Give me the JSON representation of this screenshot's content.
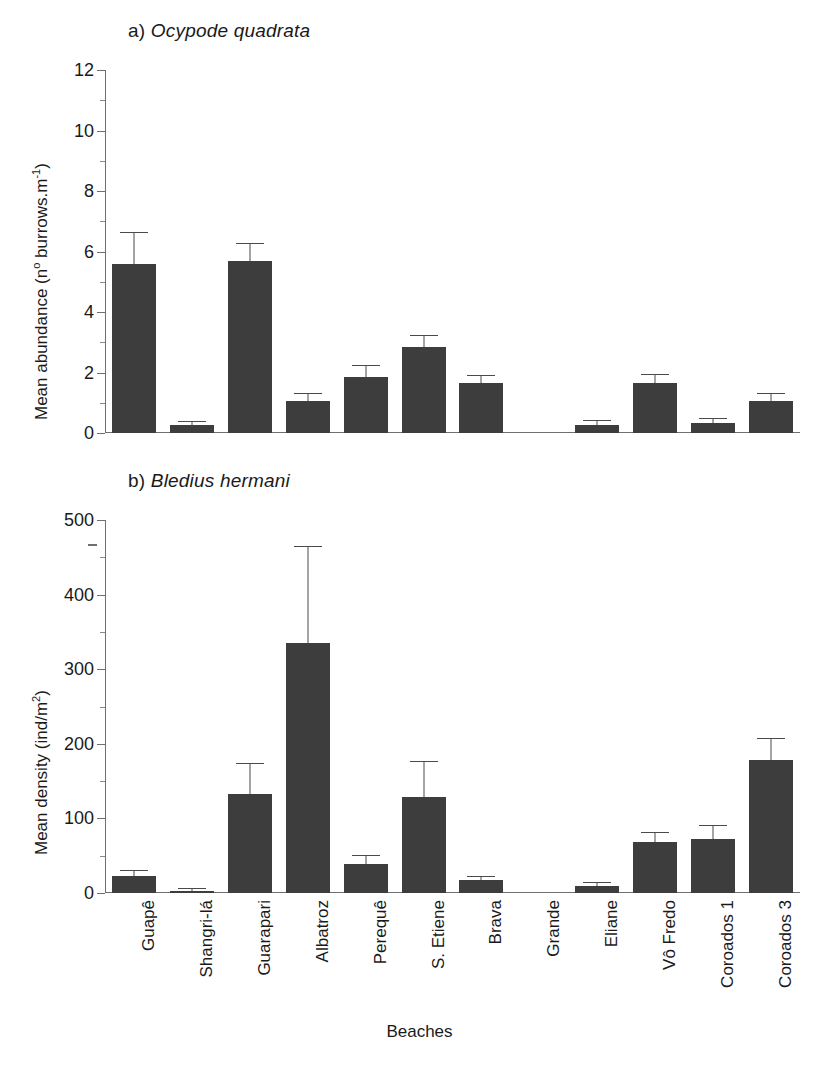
{
  "figure": {
    "xlabel": "Beaches",
    "categories": [
      "Guapê",
      "Shangri-lá",
      "Guarapari",
      "Albatroz",
      "Perequê",
      "S. Etiene",
      "Brava",
      "Grande",
      "Eliane",
      "Vô Fredo",
      "Coroados 1",
      "Coroados 3"
    ],
    "bar_color": "#3d3d3d",
    "axis_color": "#6f6f6f"
  },
  "chart_data": [
    {
      "type": "bar",
      "panel": "a",
      "title": "a) Ocypode quadrata",
      "title_prefix": "a) ",
      "title_species": "Ocypode quadrata",
      "xlabel": "Beaches",
      "ylabel": "Mean abundance (nº burrows.m-1)",
      "ylabel_plain": "Mean abundance (n",
      "ylim": [
        0,
        12
      ],
      "yticks": [
        0,
        2,
        4,
        6,
        8,
        10,
        12
      ],
      "ytick_labels": [
        "0",
        "2",
        "4",
        "6",
        "8",
        "10",
        "12"
      ],
      "grid": false,
      "legend": "none",
      "categories": [
        "Guapê",
        "Shangri-lá",
        "Guarapari",
        "Albatroz",
        "Perequê",
        "S. Etiene",
        "Brava",
        "Grande",
        "Eliane",
        "Vô Fredo",
        "Coroados 1",
        "Coroados 3"
      ],
      "values": [
        5.6,
        0.25,
        5.7,
        1.05,
        1.85,
        2.85,
        1.65,
        0,
        0.27,
        1.65,
        0.33,
        1.05
      ],
      "errors": [
        1.0,
        0.12,
        0.55,
        0.25,
        0.35,
        0.35,
        0.25,
        0,
        0.13,
        0.27,
        0.12,
        0.25
      ]
    },
    {
      "type": "bar",
      "panel": "b",
      "title": "b) Bledius hermani",
      "title_prefix": "b) ",
      "title_species": "Bledius hermani",
      "xlabel": "Beaches",
      "ylabel": "Mean density (ind/m2)",
      "ylim": [
        0,
        500
      ],
      "yticks": [
        0,
        100,
        200,
        300,
        400,
        500
      ],
      "ytick_labels": [
        "0",
        "100",
        "200",
        "300",
        "400",
        "500"
      ],
      "grid": false,
      "legend": "none",
      "categories": [
        "Guapê",
        "Shangri-lá",
        "Guarapari",
        "Albatroz",
        "Perequê",
        "S. Etiene",
        "Brava",
        "Grande",
        "Eliane",
        "Vô Fredo",
        "Coroados 1",
        "Coroados 3"
      ],
      "values": [
        23,
        3,
        133,
        335,
        39,
        129,
        18,
        0,
        10,
        68,
        72,
        178
      ],
      "errors": [
        6,
        2,
        40,
        129,
        11,
        47,
        4,
        0,
        4,
        12,
        18,
        28
      ]
    }
  ]
}
